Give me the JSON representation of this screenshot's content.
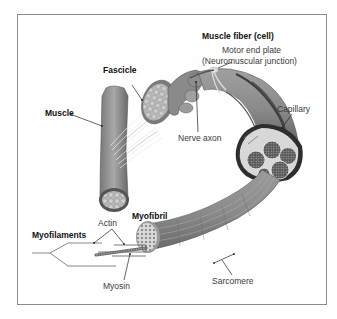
{
  "diagram": {
    "labels": {
      "muscle": "Muscle",
      "fascicle": "Fascicle",
      "muscle_fiber": "Muscle fiber (cell)",
      "motor_end_plate_line1": "Motor end plate",
      "motor_end_plate_line2": "(Neuromuscular junction)",
      "nerve_axon": "Nerve axon",
      "capillary": "Capillary",
      "myofibril": "Myofibril",
      "actin": "Actin",
      "myofilaments": "Myofilaments",
      "myosin": "Myosin",
      "sarcomere": "Sarcomere"
    },
    "colors": {
      "tissue_dark": "#6e6e6e",
      "tissue_mid": "#9a9a9a",
      "tissue_light": "#c8c8c8",
      "leader_line": "#222222",
      "border": "#8a8a8a"
    }
  }
}
